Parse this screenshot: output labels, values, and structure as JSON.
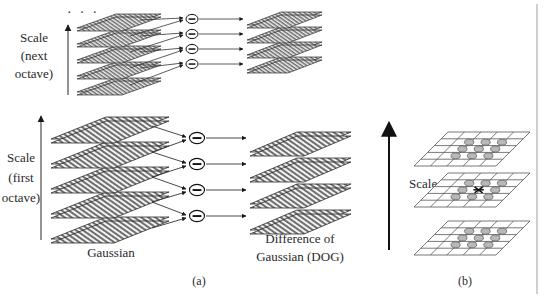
{
  "figure": {
    "background_color": "#ffffff",
    "ink_color": "#1a1a1a",
    "layer_fill_color": "#8a8a8a",
    "layer_edge_color": "#2b2b2b",
    "separator_color": "#a8a8a8",
    "width": 555,
    "height": 298
  },
  "panel_a": {
    "caption": "(a)",
    "ellipsis": "· · ·",
    "scale_axis_next_octave": {
      "line1": "Scale",
      "line2": "(next",
      "line3": "octave)",
      "icon": "up-arrow-icon"
    },
    "scale_axis_first_octave": {
      "line1": "Scale",
      "line2": "(first",
      "line3": "octave)",
      "icon": "up-arrow-icon"
    },
    "gaussian_label": "Gaussian",
    "dog_label_line1": "Difference of",
    "dog_label_line2": "Gaussian (DOG)",
    "operator_symbol": "−",
    "operator_name": "minus-circle-icon",
    "octaves": [
      {
        "name": "next-octave",
        "gaussian_layer_count": 5,
        "dog_layer_count": 4,
        "operator_count": 4
      },
      {
        "name": "first-octave",
        "gaussian_layer_count": 5,
        "dog_layer_count": 4,
        "operator_count": 4
      }
    ]
  },
  "panel_b": {
    "caption": "(b)",
    "scale_axis": {
      "label": "Scale",
      "icon": "up-arrow-icon"
    },
    "layer_count": 3,
    "grid_columns": 5,
    "grid_rows": 5,
    "neighborhood_markers": {
      "top_layer_circles": 9,
      "middle_layer_circles": 8,
      "bottom_layer_circles": 9,
      "center_marker": "x-marker-icon",
      "marker_fill_color": "#b8b8b8",
      "marker_edge_color": "#555555"
    },
    "grid_line_color": "#555555"
  }
}
